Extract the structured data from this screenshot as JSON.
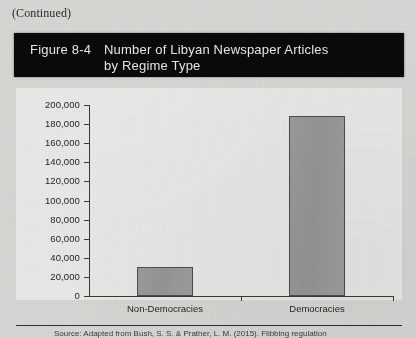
{
  "page": {
    "continued_note": "(Continued)"
  },
  "figure": {
    "number_label": "Figure 8-4",
    "title_line1": "Number of Libyan Newspaper Articles",
    "title_line2": "by Regime Type",
    "banner_color": "#0a0a0a",
    "banner_text_color": "#e9e9e9"
  },
  "source": {
    "text": "(cut off at page edge)"
  },
  "chart_data": {
    "type": "bar",
    "title": "Number of Libyan Newspaper Articles by Regime Type",
    "categories": [
      "Non-Democracies",
      "Democracies"
    ],
    "values": [
      30000,
      188000
    ],
    "xlabel": "",
    "ylabel": "",
    "ylim": [
      0,
      200000
    ],
    "ytick_values": [
      0,
      20000,
      40000,
      60000,
      80000,
      100000,
      120000,
      140000,
      160000,
      180000,
      200000
    ],
    "ytick_labels": [
      "0",
      "20,000",
      "40,000",
      "60,000",
      "80,000",
      "100,000",
      "120,000",
      "140,000",
      "160,000",
      "180,000",
      "200,000"
    ],
    "grid": false,
    "legend": null,
    "bar_fill_color": "#9a9a9a",
    "bar_border_color": "#4d4d4d",
    "plot_background": "#e9e9e7"
  }
}
